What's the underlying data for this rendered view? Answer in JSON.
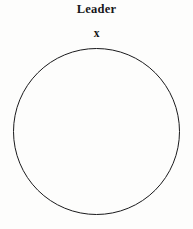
{
  "figure": {
    "title": "Leader",
    "marker_label": "x",
    "background_color": "#fdfdfc",
    "stroke_color": "#1a1a1c",
    "title_color": "#17171a"
  },
  "chart_data": {
    "type": "diagram",
    "title": "Leader",
    "shapes": [
      {
        "name": "circle",
        "kind": "circle",
        "center_x": 96.5,
        "center_y": 131.5,
        "radius": 83.0,
        "fill": "none",
        "stroke": "#1a1a1c",
        "stroke_width": 1.0
      },
      {
        "name": "leader-marker",
        "kind": "text-marker",
        "label": "x",
        "x": 97,
        "y": 34,
        "bold": true
      }
    ],
    "annotations": [
      {
        "name": "title",
        "text": "Leader",
        "x": 97,
        "y": 10
      }
    ]
  }
}
